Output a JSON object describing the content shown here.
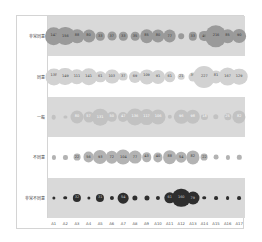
{
  "chart_data": {
    "type": "bubble-matrix",
    "title": "",
    "xlabel": "",
    "ylabel": "",
    "categories": [
      "A1",
      "A2",
      "A3",
      "A4",
      "A5",
      "A6",
      "A7",
      "A8",
      "A9",
      "A10",
      "A11",
      "A12",
      "A13",
      "A14",
      "A15",
      "A16",
      "A17"
    ],
    "series": [
      {
        "name": "非常同意",
        "band_color": "#d9d9d9",
        "bubble_color": "#9a9a9a",
        "text_color": "#333333",
        "values": [
          147,
          156,
          88,
          80,
          33,
          37,
          33,
          35,
          85,
          80,
          77,
          15,
          33,
          49,
          216,
          85,
          90
        ]
      },
      {
        "name": "同意",
        "band_color": "#ffffff",
        "bubble_color": "#d2d2d2",
        "text_color": "#444444",
        "values": [
          138,
          149,
          111,
          141,
          61,
          103,
          37,
          69,
          109,
          91,
          61,
          21,
          39,
          227,
          81,
          167,
          129
        ]
      },
      {
        "name": "一般",
        "band_color": "#d9d9d9",
        "bubble_color": "#c2c2c2",
        "text_color": "#ffffff",
        "values": [
          10,
          2,
          80,
          57,
          131,
          50,
          47,
          136,
          117,
          106,
          9,
          96,
          98,
          18,
          14,
          25,
          82
        ]
      },
      {
        "name": "不同意",
        "band_color": "#ffffff",
        "bubble_color": "#b3b3b3",
        "text_color": "#333333",
        "values": [
          8,
          8,
          22,
          56,
          93,
          72,
          104,
          77,
          43,
          40,
          88,
          54,
          82,
          22,
          11,
          8,
          9
        ]
      },
      {
        "name": "非常不同意",
        "band_color": "#d9d9d9",
        "bubble_color": "#2e2e2e",
        "text_color": "#cccccc",
        "values": [
          5,
          6,
          32,
          5,
          31,
          8,
          54,
          13,
          12,
          8,
          61,
          160,
          79,
          6,
          7,
          7,
          7
        ]
      }
    ],
    "grid": false,
    "legend": "none"
  }
}
